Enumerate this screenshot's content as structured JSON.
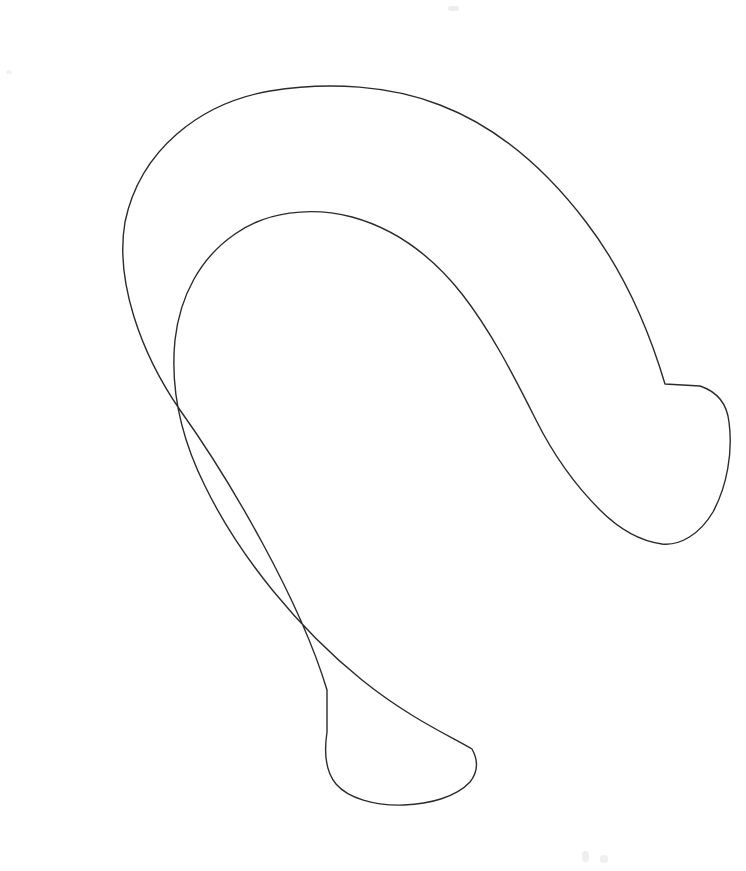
{
  "image": {
    "title": "Hook-shaped closed outline drawing",
    "kind": "line-drawing",
    "width": 746,
    "height": 871,
    "background_color": "#ffffff",
    "stroke_color": "#2b2b2b",
    "stroke_width": 1.4,
    "fill_color": "none",
    "description": "Single closed contour forming a thick hook / horseshoe band that curls counter-clockwise, with a rounded blunt tip at the right and a rounded blunt tip at the lower middle, each tip joined to the band by a small notch corner."
  },
  "shapes": {
    "contour": {
      "name": "hook-outline",
      "closed": true,
      "winding": "counter-clockwise",
      "notes": "Outer boundary sweeps from the lower-middle notch up the left side, over the top arch, down the right flank to the right notch corner; the right blunt tip caps it, then the inner boundary returns leftwards and upwards, around the inner arch, down and right to the lower blunt tip.",
      "path": "M 327 732 L 327 690 C 300 600 230 480 180 410 C 140 352 115 280 125 222 C 140 150 200 103 270 91 C 330 81 392 86 440 105 C 500 128 548 172 586 222 C 622 269 648 327 665 384 L 665 384 L 700 386 C 718 392 727 404 729 422 C 733 452 727 486 713 512 C 700 534 680 546 662 544 C 640 541 618 528 600 510 C 574 484 552 452 536 420 C 512 372 490 330 462 294 C 432 256 396 229 352 217 C 310 206 266 212 235 234 C 200 258 180 296 175 340 C 170 390 182 440 205 486 C 240 558 300 630 362 680 C 408 717 448 735 472 749 C 478 760 478 772 470 782 C 456 797 430 804 404 805 C 374 806 348 798 336 784 C 326 772 324 752 327 732 Z"
    },
    "outer_boundary": {
      "name": "outer-edge",
      "path": "M 327 732 L 327 690 C 300 600 230 480 180 410 C 140 352 115 280 125 222 C 140 150 200 103 270 91 C 330 81 392 86 440 105 C 500 128 548 172 586 222 C 622 269 648 327 665 384"
    },
    "right_tip": {
      "name": "right-blunt-tip",
      "notch_corner": [
        665,
        384
      ],
      "extreme_point": [
        729,
        430
      ],
      "bottom_point": [
        678,
        543
      ]
    },
    "inner_boundary": {
      "name": "inner-edge",
      "apex": [
        322,
        215
      ],
      "leftmost": [
        170,
        355
      ]
    },
    "bottom_tip": {
      "name": "bottom-blunt-tip",
      "notch_corner": [
        327,
        732
      ],
      "rightmost_point": [
        478,
        750
      ],
      "bottom_point": [
        402,
        805
      ]
    },
    "extremes": {
      "outer_leftmost": [
        44,
        425
      ],
      "outer_top": [
        330,
        88
      ],
      "outer_rightmost": [
        730,
        430
      ],
      "outer_bottom": [
        402,
        805
      ]
    }
  },
  "artifacts": [
    {
      "name": "scan-speck-top",
      "x": 448,
      "y": 6,
      "w": 11,
      "h": 5,
      "color": "#ededed"
    },
    {
      "name": "scan-speck-bottom-left",
      "x": 582,
      "y": 851,
      "w": 7,
      "h": 11,
      "color": "#efefef"
    },
    {
      "name": "scan-speck-bottom-right",
      "x": 600,
      "y": 855,
      "w": 8,
      "h": 8,
      "color": "#f0f0f0"
    },
    {
      "name": "scan-speck-mid-left",
      "x": 6,
      "y": 70,
      "w": 6,
      "h": 4,
      "color": "#f2f2f2"
    }
  ],
  "labels": {
    "figure_caption": "",
    "alt_text": "Closed hook-shaped outline"
  }
}
